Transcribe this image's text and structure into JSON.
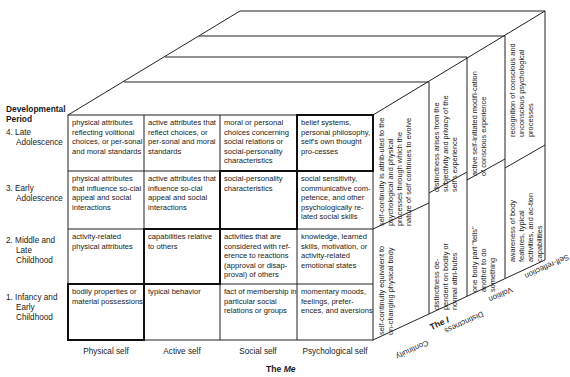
{
  "diagram": {
    "row_axis_title": "Developmental Period",
    "rows": [
      {
        "label_line1": "4. Late",
        "label_line2": "Adolescence"
      },
      {
        "label_line1": "3. Early",
        "label_line2": "Adolescence"
      },
      {
        "label_line1": "2. Middle and",
        "label_line2": "Late",
        "label_line3": "Childhood"
      },
      {
        "label_line1": "1. Infancy and",
        "label_line2": "Early",
        "label_line3": "Childhood"
      }
    ],
    "columns": [
      "Physical self",
      "Active self",
      "Social self",
      "Psychological self"
    ],
    "me_title_prefix": "The",
    "me_title_word": "Me",
    "cells": [
      [
        "physical attributes reflecting volitional choices, or per-sonal and moral standards",
        "active attributes that reflect choices, or per-sonal and moral standards",
        "moral or personal choices concerning social relations or social-personality characteristics",
        "belief systems, personal philosophy, self's own thought pro-cesses"
      ],
      [
        "physical attributes that influence so-cial appeal and social interactions",
        "active attributes that influence so-cial appeal and social interactions",
        "social-personality characteristics",
        "social sensitivity, communicative com-petence, and other psychologically re-lated social skills"
      ],
      [
        "activity-related physical attributes",
        "capabilities relative to others",
        "activities that are considered with ref-erence to reactions (approval or disap-proval) of others",
        "knowledge, learned skills, motivation, or activity-related emotional states"
      ],
      [
        "bodily properties or material possessions",
        "typical behavior",
        "fact of membership in particular social relations or groups",
        "momentary moods, feelings, prefer-ences, and aversions"
      ]
    ],
    "i_dimensions": [
      "Continuity",
      "Distinctness",
      "Volition",
      "Self-reflection"
    ],
    "i_title_prefix": "The",
    "i_title_word": "I",
    "i_cells": {
      "continuity_lower": "self-continuity equivalent to un-changing physical body",
      "continuity_upper": "self-continuity is attrib-uted to the psychological and physical processes through which the nature of self continues to evolve",
      "distinctness_lower": "distinctness de-pendent on bodily or normal attri-butes",
      "distinctness_upper": "distinctness arises from the subjectivity and privacy of the self's experience",
      "volition_lower": "one body part \"tells\" another to do something",
      "volition_upper": "active self-initiated modifi-cation of conscious experience",
      "selfreflection_lower": "awareness of body features, typical activities, and ac-tion capabilities",
      "selfreflection_upper": "recognition of conscious and unconscious psychological processes"
    },
    "highlighted_cells": [
      [
        3,
        0
      ],
      [
        2,
        1
      ],
      [
        1,
        2
      ],
      [
        0,
        3
      ]
    ]
  }
}
